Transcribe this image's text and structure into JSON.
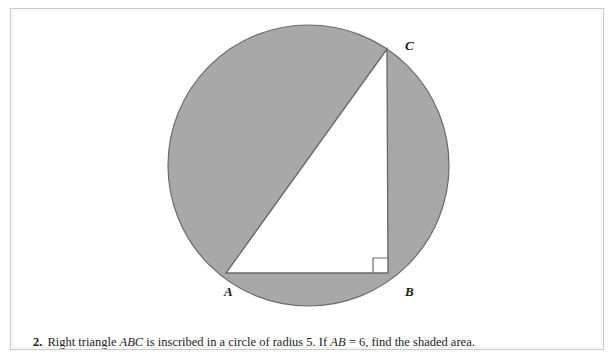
{
  "page": {
    "background_color": "#ffffff",
    "frame_border_color": "#c9c9c9"
  },
  "figure": {
    "name": "circle-with-inscribed-right-triangle",
    "shaded_region_color": "#a8a8a8",
    "outline_color": "#6b6b6b",
    "triangle_fill_color": "#ffffff",
    "circle": {
      "center_x": 297.5,
      "center_y": 156.5,
      "radius": 140.5
    },
    "vertices": {
      "A": {
        "label": "A",
        "x": 215,
        "y": 264
      },
      "B": {
        "label": "B",
        "x": 377,
        "y": 264
      },
      "C": {
        "label": "C",
        "x": 376,
        "y": 40
      }
    },
    "right_angle_marker": {
      "at_vertex": "B",
      "size": 15
    }
  },
  "problem": {
    "number": "2.",
    "segment_1": "Right triangle ",
    "var_abc": "ABC",
    "segment_2": " is inscribed in a circle of radius 5. If ",
    "var_ab": "AB",
    "segment_3": " = 6, find the shaded area."
  }
}
